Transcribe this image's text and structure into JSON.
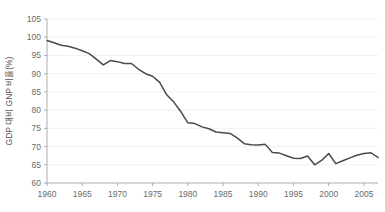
{
  "chart_data": {
    "type": "line",
    "title": "",
    "xlabel": "",
    "ylabel": "GDP 대비 GNP 비율(%)",
    "xlim": [
      1960,
      2007
    ],
    "ylim": [
      60,
      105
    ],
    "grid": true,
    "legend": "none",
    "x_ticks": [
      "1960",
      "1965",
      "1970",
      "1975",
      "1980",
      "1985",
      "1990",
      "1995",
      "2000",
      "2005"
    ],
    "x_tick_values": [
      1960,
      1965,
      1970,
      1975,
      1980,
      1985,
      1990,
      1995,
      2000,
      2005
    ],
    "y_ticks": [
      "60",
      "65",
      "70",
      "75",
      "80",
      "85",
      "90",
      "95",
      "100",
      "105"
    ],
    "y_tick_values": [
      60,
      65,
      70,
      75,
      80,
      85,
      90,
      95,
      100,
      105
    ],
    "line_color": "#4a4a4a",
    "grid_color": "#e9e9e9",
    "axis_color": "#9a9a9a",
    "background_color": "#ffffff",
    "x": [
      1960,
      1961,
      1962,
      1963,
      1964,
      1965,
      1966,
      1967,
      1968,
      1969,
      1970,
      1971,
      1972,
      1973,
      1974,
      1975,
      1976,
      1977,
      1978,
      1979,
      1980,
      1981,
      1982,
      1983,
      1984,
      1985,
      1986,
      1987,
      1988,
      1989,
      1990,
      1991,
      1992,
      1993,
      1994,
      1995,
      1996,
      1997,
      1998,
      1999,
      2000,
      2001,
      2002,
      2003,
      2004,
      2005,
      2006,
      2007
    ],
    "values": [
      99.1,
      98.5,
      97.8,
      97.5,
      97.0,
      96.3,
      95.5,
      94.0,
      92.4,
      93.6,
      93.3,
      92.8,
      92.8,
      91.2,
      90.0,
      89.3,
      87.6,
      84.2,
      82.2,
      79.6,
      76.5,
      76.3,
      75.4,
      74.9,
      74.0,
      73.8,
      73.6,
      72.4,
      70.8,
      70.5,
      70.4,
      70.6,
      68.4,
      68.2,
      67.5,
      66.8,
      66.7,
      67.4,
      65.0,
      66.2,
      68.1,
      65.3,
      66.1,
      66.9,
      67.6,
      68.1,
      68.3,
      67.0
    ],
    "series_name": "GDP 대비 GNP 비율"
  }
}
